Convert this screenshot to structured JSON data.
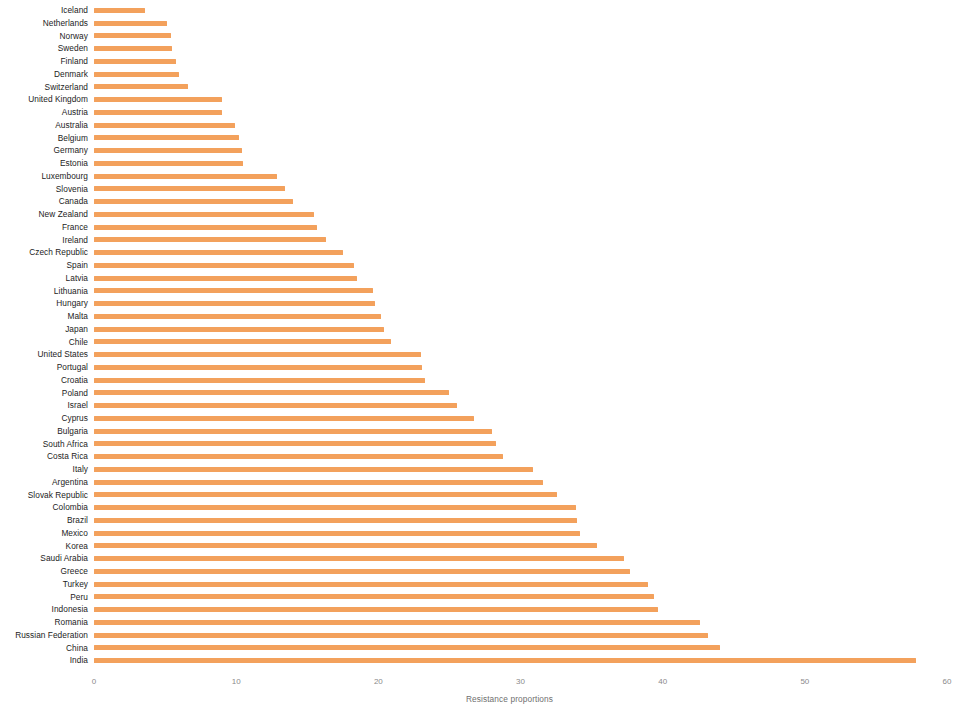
{
  "chart_data": {
    "type": "bar",
    "orientation": "horizontal",
    "title": "",
    "subtitle": "",
    "xlabel": "Resistance proportions",
    "ylabel": "",
    "xlim": [
      0,
      60
    ],
    "xticks": [
      0,
      10,
      20,
      30,
      40,
      50,
      60
    ],
    "xtick_labels": [
      "0",
      "10",
      "20",
      "30",
      "40",
      "50",
      "60"
    ],
    "grid": false,
    "legend": null,
    "bar_color": "#f3a15c",
    "label_color": "#1c1c1c",
    "tick_color": "#8a8a8a",
    "sort_order": "ascending",
    "categories": [
      "Iceland",
      "Netherlands",
      "Norway",
      "Sweden",
      "Finland",
      "Denmark",
      "Switzerland",
      "United Kingdom",
      "Austria",
      "Australia",
      "Belgium",
      "Germany",
      "Estonia",
      "Luxembourg",
      "Slovenia",
      "Canada",
      "New Zealand",
      "France",
      "Ireland",
      "Czech Republic",
      "Spain",
      "Latvia",
      "Lithuania",
      "Hungary",
      "Malta",
      "Japan",
      "Chile",
      "United States",
      "Portugal",
      "Croatia",
      "Poland",
      "Israel",
      "Cyprus",
      "Bulgaria",
      "South Africa",
      "Costa Rica",
      "Italy",
      "Argentina",
      "Slovak Republic",
      "Colombia",
      "Brazil",
      "Mexico",
      "Korea",
      "Saudi Arabia",
      "Greece",
      "Turkey",
      "Peru",
      "Indonesia",
      "Romania",
      "Russian Federation",
      "China",
      "India"
    ],
    "values": [
      3.6,
      5.1,
      5.4,
      5.5,
      5.8,
      6.0,
      6.6,
      9.0,
      9.0,
      9.9,
      10.2,
      10.4,
      10.5,
      12.9,
      13.4,
      14.0,
      15.5,
      15.7,
      16.3,
      17.5,
      18.3,
      18.5,
      19.6,
      19.8,
      20.2,
      20.4,
      20.9,
      23.0,
      23.1,
      23.3,
      25.0,
      25.5,
      26.7,
      28.0,
      28.3,
      28.8,
      30.9,
      31.6,
      32.6,
      33.9,
      34.0,
      34.2,
      35.4,
      37.3,
      37.7,
      39.0,
      39.4,
      39.7,
      42.6,
      43.2,
      44.0,
      57.8
    ]
  }
}
